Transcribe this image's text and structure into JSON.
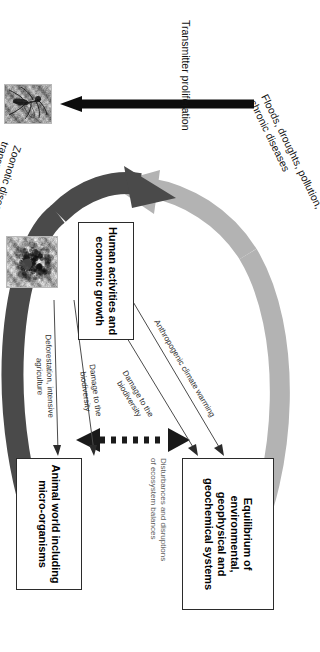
{
  "figure": {
    "type": "conceptual-flow-diagram",
    "orientation": "rotated-90-clockwise",
    "nodes": [
      {
        "id": "human",
        "label": "Human activities and economic growth",
        "shape": "rectangle"
      },
      {
        "id": "equilibrium",
        "label": "Equilibrium of environmental, geophysical and geochemical systems",
        "shape": "rectangle"
      },
      {
        "id": "animal",
        "label": "Animal world including micro-organisms",
        "shape": "rectangle"
      }
    ],
    "edge_labels": {
      "anthropogenic_warming": "Anthropogenic climate warming",
      "damage_biodiversity_upper": "Damage to the biodiversity",
      "damage_biodiversity_lower": "Damage to the biodiversity",
      "deforestation": "Deforestation, intensive agriculture",
      "disturbances": "Disturbances and disruptions of ecosystem balances"
    },
    "curved_arrows": [
      {
        "id": "feedback-environment",
        "label": "Floods, droughts, pollution, chronic diseases",
        "color": "#b3b3b3",
        "from": "equilibrium",
        "to": "human"
      },
      {
        "id": "feedback-animal",
        "label": "Zoonotic diseases transmitted by wildlife",
        "color": "#4a4a4a",
        "from": "animal",
        "to": "human"
      }
    ],
    "straight_arrow": {
      "id": "transmitter-proliferation",
      "label": "Transmitter proliferation",
      "color": "#0d0d0d"
    },
    "images": [
      {
        "id": "mosquito-photo",
        "alt": "mosquito-photograph"
      },
      {
        "id": "microorganism-photo",
        "alt": "micrograph-of-microorganisms"
      }
    ],
    "colors": {
      "light_arrow": "#b3b3b3",
      "dark_arrow": "#4a4a4a",
      "black_arrow": "#0d0d0d",
      "box_border": "#2b2b2b",
      "label_grey": "#5d5d5d",
      "background": "#ffffff"
    }
  }
}
